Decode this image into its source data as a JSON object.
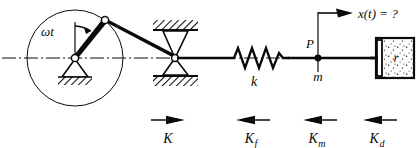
{
  "figure": {
    "background_color": "#ffffff",
    "ink_color": "#0a0a0a",
    "width": 418,
    "height": 148
  },
  "labels": {
    "crank_angle": "ωt",
    "spring_stiffness": "k",
    "point_p": "P",
    "mass": "m",
    "damper_coefficient": "r",
    "displacement_query": "x(t) = ?"
  },
  "forces": [
    {
      "id": "force-k",
      "label": "K",
      "base": "K",
      "sub": "",
      "direction": "right",
      "arrow_x": 168,
      "label_x": 168,
      "label_y": 143
    },
    {
      "id": "force-kf",
      "label": "Kf",
      "base": "K",
      "sub": "f",
      "direction": "left",
      "arrow_x": 253,
      "label_x": 251,
      "label_y": 143
    },
    {
      "id": "force-km",
      "label": "Km",
      "base": "K",
      "sub": "m",
      "direction": "left",
      "arrow_x": 320,
      "label_x": 317,
      "label_y": 143
    },
    {
      "id": "force-kd",
      "label": "Kd",
      "base": "K",
      "sub": "d",
      "direction": "left",
      "arrow_x": 380,
      "label_x": 377,
      "label_y": 143
    }
  ],
  "components": {
    "crank_circle": {
      "cx": 75,
      "cy": 58,
      "r": 48
    },
    "crank_pivot": {
      "x": 75,
      "y": 58
    },
    "crank_pin": {
      "x": 105,
      "y": 20
    },
    "slider_block": {
      "x": 175,
      "y": 58
    },
    "spring": {
      "x_start": 228,
      "x_end": 288,
      "coils": 4
    },
    "mass_point": {
      "x": 318,
      "y": 58
    },
    "damper_box": {
      "x": 376,
      "y": 38,
      "w": 38,
      "h": 40
    },
    "centerline_y": 58
  }
}
